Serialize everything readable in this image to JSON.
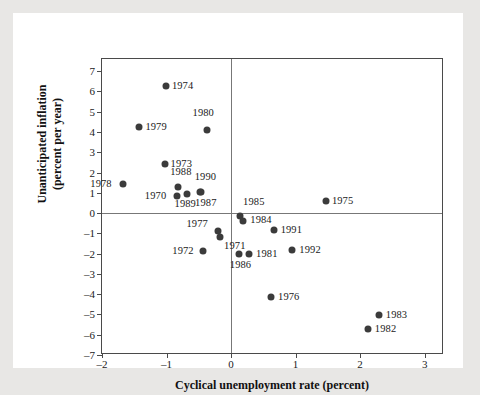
{
  "chart_data": {
    "type": "scatter",
    "title": "",
    "xlabel": "Cyclical unemployment rate (percent)",
    "ylabel": "Unanticipated inflation (percent per year)",
    "ylabel_line1": "Unanticipated inflation",
    "ylabel_line2": "(percent per year)",
    "xlim": [
      -2,
      3.3
    ],
    "ylim": [
      -7,
      7.6
    ],
    "xticks": [
      -2,
      -1,
      0,
      1,
      2,
      3
    ],
    "xticklabels": [
      "–2",
      "–1",
      "0",
      "1",
      "2",
      "3"
    ],
    "yticks": [
      7,
      6,
      5,
      4,
      3,
      2,
      1,
      0,
      -1,
      -2,
      -3,
      -4,
      -5,
      -6,
      -7
    ],
    "yticklabels": [
      "7",
      "6",
      "5",
      "4",
      "3",
      "2",
      "1",
      "0",
      "–1",
      "–2",
      "–3",
      "–4",
      "–5",
      "–6",
      "–7"
    ],
    "grid": false,
    "legend": "none",
    "reference_lines": [
      {
        "axis": "y",
        "value": 0
      },
      {
        "axis": "x",
        "value": 0
      }
    ],
    "marker_color": "#3b3b3b",
    "points": [
      {
        "label": "1974",
        "x": -1.01,
        "y": 6.25,
        "lx": 6,
        "ly": -6
      },
      {
        "label": "1979",
        "x": -1.42,
        "y": 4.25,
        "lx": 6,
        "ly": -6
      },
      {
        "label": "1980",
        "x": -0.38,
        "y": 4.08,
        "lx": -14,
        "ly": -23
      },
      {
        "label": "1973",
        "x": -1.03,
        "y": 2.42,
        "lx": 6,
        "ly": -6
      },
      {
        "label": "1988",
        "x": -0.82,
        "y": 1.28,
        "lx": -8,
        "ly": -21
      },
      {
        "label": "1978",
        "x": -1.67,
        "y": 1.45,
        "lx": -33,
        "ly": -6
      },
      {
        "label": "1990",
        "x": -0.47,
        "y": 1.02,
        "lx": -6,
        "ly": -21
      },
      {
        "label": "1970",
        "x": -0.84,
        "y": 0.85,
        "lx": -32,
        "ly": -6
      },
      {
        "label": "1989",
        "x": -0.69,
        "y": 0.92,
        "lx": -12,
        "ly": 4
      },
      {
        "label": "1987",
        "x": -0.48,
        "y": 1.05,
        "lx": -5,
        "ly": 5
      },
      {
        "label": "1985",
        "x": 0.14,
        "y": -0.12,
        "lx": 3,
        "ly": -20
      },
      {
        "label": "1984",
        "x": 0.19,
        "y": -0.38,
        "lx": 7,
        "ly": -7
      },
      {
        "label": "1975",
        "x": 1.47,
        "y": 0.6,
        "lx": 6,
        "ly": -6
      },
      {
        "label": "1991",
        "x": 0.66,
        "y": -0.85,
        "lx": 7,
        "ly": -6
      },
      {
        "label": "1977",
        "x": -0.21,
        "y": -0.88,
        "lx": -31,
        "ly": -13
      },
      {
        "label": "1971",
        "x": -0.17,
        "y": -1.18,
        "lx": 4,
        "ly": 3
      },
      {
        "label": "1972",
        "x": -0.43,
        "y": -1.85,
        "lx": -31,
        "ly": -6
      },
      {
        "label": "1986",
        "x": 0.12,
        "y": -2.0,
        "lx": -9,
        "ly": 5
      },
      {
        "label": "1981",
        "x": 0.28,
        "y": -2.02,
        "lx": 7,
        "ly": -6
      },
      {
        "label": "1992",
        "x": 0.95,
        "y": -1.82,
        "lx": 7,
        "ly": -6
      },
      {
        "label": "1976",
        "x": 0.62,
        "y": -4.12,
        "lx": 7,
        "ly": -6
      },
      {
        "label": "1983",
        "x": 2.29,
        "y": -5.05,
        "lx": 7,
        "ly": -6
      },
      {
        "label": "1982",
        "x": 2.12,
        "y": -5.72,
        "lx": 7,
        "ly": -6
      }
    ]
  }
}
